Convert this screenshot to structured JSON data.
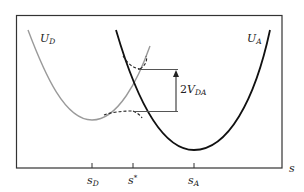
{
  "diagram": {
    "curves": [
      {
        "id": "U_D",
        "label_main": "U",
        "label_sub": "D",
        "color": "#9a9a9a",
        "minimum_at": "s_D"
      },
      {
        "id": "U_A",
        "label_main": "U",
        "label_sub": "A",
        "color": "#111111",
        "minimum_at": "s_A"
      }
    ],
    "axis": {
      "label": "s",
      "ticks": [
        {
          "main": "s",
          "sub": "D",
          "sup": ""
        },
        {
          "main": "s",
          "sub": "",
          "sup": "*"
        },
        {
          "main": "s",
          "sub": "A",
          "sup": ""
        }
      ]
    },
    "gap_annotation": {
      "prefix": "2",
      "main": "V",
      "sub": "DA"
    },
    "colors": {
      "frame": "#333333",
      "gray_curve": "#9a9a9a",
      "black_curve": "#111111",
      "annotation": "#333333"
    }
  }
}
